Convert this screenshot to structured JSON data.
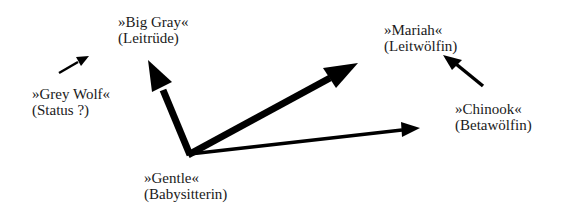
{
  "diagram": {
    "type": "dominance-hierarchy",
    "colors": {
      "background": "#ffffff",
      "arrow": "#000000",
      "text": "#1a1a1a"
    },
    "nodes": [
      {
        "id": "big-gray",
        "name": "»Big Gray«",
        "role": "(Leitrüde)",
        "x": 118,
        "y": 14
      },
      {
        "id": "mariah",
        "name": "»Mariah«",
        "role": "(Leitwölfin)",
        "x": 384,
        "y": 21
      },
      {
        "id": "grey-wolf",
        "name": "»Grey Wolf«",
        "role": "(Status ?)",
        "x": 32,
        "y": 86
      },
      {
        "id": "chinook",
        "name": "»Chinook«",
        "role": "(Betawölfin)",
        "x": 455,
        "y": 102
      },
      {
        "id": "gentle",
        "name": "»Gentle«",
        "role": "(Babysitterin)",
        "x": 144,
        "y": 170
      }
    ],
    "edges": [
      {
        "from": "gentle",
        "to": "big-gray",
        "weight": "thick"
      },
      {
        "from": "gentle",
        "to": "mariah",
        "weight": "thick"
      },
      {
        "from": "gentle",
        "to": "chinook",
        "weight": "thin"
      },
      {
        "from": "chinook",
        "to": "mariah",
        "weight": "medium"
      },
      {
        "from": "grey-wolf",
        "to": "big-gray",
        "weight": "thin"
      }
    ]
  }
}
